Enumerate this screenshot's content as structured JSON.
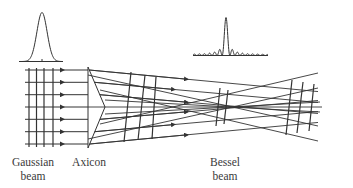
{
  "diagram": {
    "line_color": "#333333",
    "background": "#ffffff",
    "labels": {
      "gaussian_line1": "Gaussian",
      "gaussian_line2": "beam",
      "axicon": "Axicon",
      "bessel_line1": "Bessel",
      "bessel_line2": "beam"
    },
    "components": [
      {
        "id": "gaussian-profile",
        "type": "intensity-profile",
        "shape": "gaussian"
      },
      {
        "id": "gaussian-beam",
        "type": "parallel-rays",
        "ray_count": 7,
        "wavefront_count": 4
      },
      {
        "id": "axicon",
        "type": "conical-lens"
      },
      {
        "id": "bessel-region",
        "type": "crossing-rays"
      },
      {
        "id": "bessel-profile",
        "type": "intensity-profile",
        "shape": "bessel-squared"
      }
    ]
  }
}
